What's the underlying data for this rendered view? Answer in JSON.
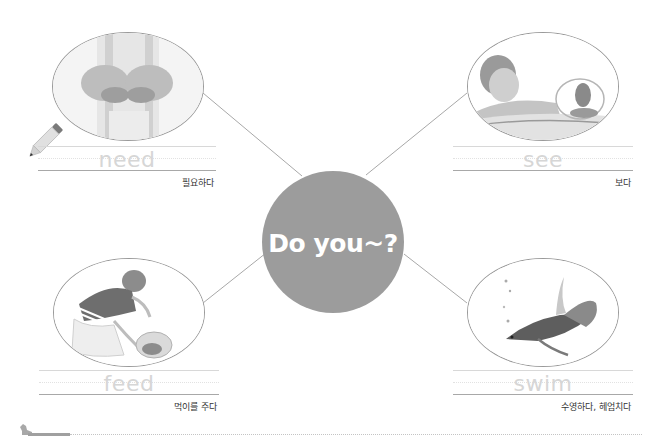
{
  "center": {
    "title": "Do you~?",
    "circle_color": "#9c9c9c",
    "text_color": "#ffffff"
  },
  "items": [
    {
      "word": "need",
      "meaning": "필요하다",
      "image": "cupped-hands-photo"
    },
    {
      "word": "see",
      "meaning": "보다",
      "image": "girl-looking-at-fishbowl-photo"
    },
    {
      "word": "feed",
      "meaning": "먹이를 주다",
      "image": "girl-feeding-fish-photo"
    },
    {
      "word": "swim",
      "meaning": "수영하다, 헤엄치다",
      "image": "betta-fish-photo"
    }
  ],
  "icons": {
    "pencil": "pencil-icon",
    "footer_mascot": "dog-icon"
  },
  "colors": {
    "connector": "#a8a8a8",
    "trace_word": "#d6d6d6",
    "ellipse_border": "#9a9a9a"
  }
}
